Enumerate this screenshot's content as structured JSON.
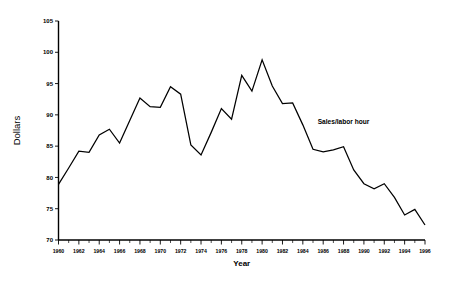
{
  "chart_data": {
    "type": "line",
    "title": "",
    "xlabel": "Year",
    "ylabel": "Dollars",
    "xlim": [
      1960,
      1996
    ],
    "ylim": [
      70,
      105
    ],
    "grid": false,
    "legend_position": "inline-annotation",
    "annotations": [
      {
        "text": "Sales/labor hour",
        "x": 1988,
        "y": 88.5
      }
    ],
    "x_tick_labels": [
      "1960",
      "1962",
      "1964",
      "1966",
      "1968",
      "1970",
      "1972",
      "1974",
      "1976",
      "1978",
      "1980",
      "1982",
      "1984",
      "1986",
      "1988",
      "1990",
      "1992",
      "1994",
      "1996"
    ],
    "x_tick_values": [
      1960,
      1962,
      1964,
      1966,
      1968,
      1970,
      1972,
      1974,
      1976,
      1978,
      1980,
      1982,
      1984,
      1986,
      1988,
      1990,
      1992,
      1994,
      1996
    ],
    "x_minor_tick_values": [
      1961,
      1963,
      1965,
      1967,
      1969,
      1971,
      1973,
      1975,
      1977,
      1979,
      1981,
      1983,
      1985,
      1987,
      1989,
      1991,
      1993,
      1995
    ],
    "y_tick_labels": [
      "70",
      "75",
      "80",
      "85",
      "90",
      "95",
      "100",
      "105"
    ],
    "y_tick_values": [
      70,
      75,
      80,
      85,
      90,
      95,
      100,
      105
    ],
    "series": [
      {
        "name": "Sales/labor hour",
        "color": "#000000",
        "x": [
          1960,
          1961,
          1962,
          1963,
          1964,
          1965,
          1966,
          1967,
          1968,
          1969,
          1970,
          1971,
          1972,
          1973,
          1974,
          1975,
          1976,
          1977,
          1978,
          1979,
          1980,
          1981,
          1982,
          1983,
          1984,
          1985,
          1986,
          1987,
          1988,
          1989,
          1990,
          1991,
          1992,
          1993,
          1994,
          1995,
          1996
        ],
        "values": [
          78.9,
          81.5,
          84.2,
          84.0,
          86.8,
          87.7,
          85.5,
          89.1,
          92.7,
          91.3,
          91.2,
          94.5,
          93.3,
          85.2,
          83.6,
          87.2,
          91.0,
          89.3,
          96.3,
          93.8,
          98.8,
          94.6,
          91.8,
          91.9,
          88.4,
          84.5,
          84.1,
          84.4,
          84.9,
          81.2,
          79.0,
          78.2,
          79.0,
          76.8,
          74.0,
          74.9,
          72.4
        ]
      }
    ]
  },
  "axes": {
    "y_title": "Dollars",
    "x_title": "Year"
  }
}
